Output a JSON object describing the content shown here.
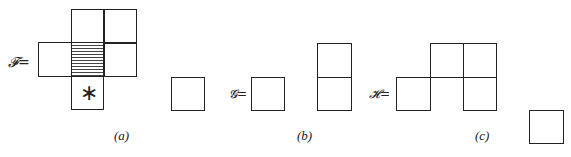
{
  "figure": {
    "panels": [
      {
        "caption": "(a)",
        "label": "𝓕=",
        "description": "Cross-shaped polyomino with hatched center cell and asterisk cell below, plus a separate single square"
      },
      {
        "caption": "(b)",
        "label": "𝓖=",
        "description": "Single square and a vertical domino"
      },
      {
        "caption": "(c)",
        "label": "𝓗=",
        "description": "Five-cell shape plus a separate single square"
      }
    ],
    "marker": "∗"
  }
}
